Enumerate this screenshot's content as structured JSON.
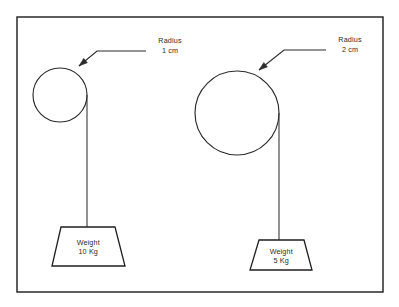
{
  "diagram": {
    "background_color": "#ffffff",
    "frame_color": "#1a1a1a",
    "line_color": "#2b2b2b",
    "text_color": "#2a2a2a"
  },
  "assemblies": [
    {
      "id": "left",
      "pulley": {
        "name": "left-pulley",
        "cx": 60,
        "cy": 95,
        "r": 27,
        "radius_label_line1": "Radius",
        "radius_label_line2": "1 cm"
      },
      "string": {
        "name": "left-string",
        "x": 87,
        "y_top": 95,
        "y_bottom": 227
      },
      "weight": {
        "name": "left-weight",
        "label_line1": "Weight",
        "label_line2": "10 Kg",
        "top_left_x": 61,
        "top_right_x": 115,
        "bottom_left_x": 52,
        "bottom_right_x": 125,
        "top_y": 227,
        "bottom_y": 266
      },
      "leader": {
        "name": "left-leader",
        "h_start_x": 146,
        "h_end_x": 97,
        "h_y": 51,
        "arrow_x": 79,
        "arrow_y": 66
      },
      "label_position": {
        "x": 170,
        "y_line1": 43,
        "y_line2": 53
      }
    },
    {
      "id": "right",
      "pulley": {
        "name": "right-pulley",
        "cx": 237,
        "cy": 113,
        "r": 42,
        "radius_label_line1": "Radius",
        "radius_label_line2": "2 cm"
      },
      "string": {
        "name": "right-string",
        "x": 279,
        "y_top": 113,
        "y_bottom": 240
      },
      "weight": {
        "name": "right-weight",
        "label_line1": "Weight",
        "label_line2": "5 Kg",
        "top_left_x": 259,
        "top_right_x": 304,
        "bottom_left_x": 250,
        "bottom_right_x": 312,
        "top_y": 240,
        "bottom_y": 270
      },
      "leader": {
        "name": "right-leader",
        "h_start_x": 326,
        "h_end_x": 284,
        "h_y": 50,
        "arrow_x": 259,
        "arrow_y": 70
      },
      "label_position": {
        "x": 350,
        "y_line1": 42,
        "y_line2": 52
      }
    }
  ],
  "frame": {
    "name": "diagram-frame",
    "x": 17,
    "y": 17,
    "width": 366,
    "height": 275
  }
}
